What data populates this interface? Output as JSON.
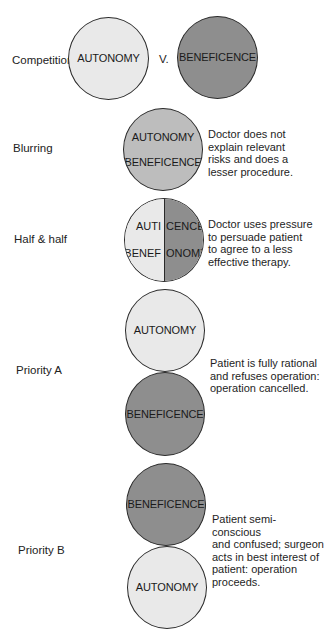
{
  "diagram": {
    "rows": [
      {
        "label": "Competition",
        "circles": [
          {
            "text": "AUTONOMY",
            "shade": "light"
          },
          {
            "text": "BENEFICENCE",
            "shade": "dark"
          }
        ],
        "separator": "V."
      },
      {
        "label": "Blurring",
        "circle_lines": [
          "AUTONOMY",
          "BENEFICENCE"
        ],
        "shade": "medium",
        "description": "Doctor does not\nexplain relevant\nrisks and does a\nlesser procedure."
      },
      {
        "label": "Half & half",
        "left_half": {
          "top": "AUTI",
          "bottom": "BENEF",
          "shade": "light"
        },
        "right_half": {
          "top": "CENCE",
          "bottom": "ONOMY",
          "shade": "dark"
        },
        "description": "Doctor uses pressure\nto persuade patient\nto agree to a less\neffective therapy."
      },
      {
        "label": "Priority A",
        "top_circle": {
          "text": "AUTONOMY",
          "shade": "light"
        },
        "bottom_circle": {
          "text": "BENEFICENCE",
          "shade": "dark"
        },
        "description": "Patient is fully rational\nand refuses operation:\noperation cancelled."
      },
      {
        "label": "Priority B",
        "top_circle": {
          "text": "BENEFICENCE",
          "shade": "dark"
        },
        "bottom_circle": {
          "text": "AUTONOMY",
          "shade": "light"
        },
        "description": "Patient semi-conscious\nand confused; surgeon\nacts in best interest of\npatient: operation\nproceeds."
      }
    ],
    "colors": {
      "light": "#e9e9e9",
      "medium": "#bdbdbd",
      "dark": "#8e8e8e",
      "outline": "#2a2a2a"
    }
  }
}
